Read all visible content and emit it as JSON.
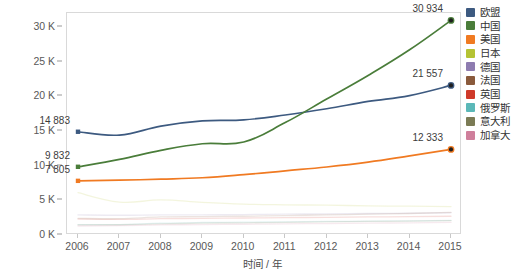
{
  "chart_data": {
    "type": "line",
    "title": "",
    "xlabel": "时间 / 年",
    "ylabel": "论文数量 / 篇",
    "x": [
      2006,
      2007,
      2008,
      2009,
      2010,
      2011,
      2012,
      2013,
      2014,
      2015
    ],
    "xtick_labels": [
      "2006",
      "2007",
      "2008",
      "2009",
      "2010",
      "2011",
      "2012",
      "2013",
      "2014",
      "2015"
    ],
    "ytick_labels": [
      "0 K",
      "5 K",
      "10 K",
      "15 K",
      "20 K",
      "25 K",
      "30 K"
    ],
    "ytick_values": [
      0,
      5000,
      10000,
      15000,
      20000,
      25000,
      30000
    ],
    "ylim": [
      0,
      32000
    ],
    "xlim": [
      2006,
      2015
    ],
    "grid": false,
    "legend_position": "right",
    "series": [
      {
        "name": "欧盟",
        "color": "#3d5a80",
        "emphasis": "strong",
        "values": [
          14883,
          14400,
          15700,
          16450,
          16600,
          17300,
          18200,
          19250,
          20100,
          21557
        ],
        "start_label": "14 883",
        "end_label": "21 557"
      },
      {
        "name": "中国",
        "color": "#4a7d3a",
        "emphasis": "strong",
        "values": [
          9832,
          10900,
          12200,
          13150,
          13400,
          16200,
          19600,
          23000,
          26700,
          30934
        ],
        "start_label": "9 832",
        "end_label": "30 934"
      },
      {
        "name": "美国",
        "color": "#f07a22",
        "emphasis": "strong",
        "values": [
          7805,
          7900,
          8050,
          8250,
          8700,
          9250,
          9800,
          10500,
          11400,
          12333
        ],
        "start_label": "7 805",
        "end_label": "12 333"
      },
      {
        "name": "日本",
        "color": "#b5c334",
        "emphasis": "faded",
        "values": [
          6100,
          4750,
          5050,
          4700,
          4450,
          4350,
          4300,
          4200,
          4150,
          4100
        ]
      },
      {
        "name": "德国",
        "color": "#8e7cb0",
        "emphasis": "faded",
        "values": [
          2900,
          2850,
          2900,
          2900,
          2950,
          3000,
          3050,
          3100,
          3150,
          3200
        ]
      },
      {
        "name": "法国",
        "color": "#8a5a3c",
        "emphasis": "faded",
        "values": [
          2400,
          2350,
          2600,
          2650,
          2700,
          2800,
          2900,
          3000,
          3100,
          3250
        ]
      },
      {
        "name": "英国",
        "color": "#cf3a2a",
        "emphasis": "faded",
        "values": [
          2300,
          2250,
          2350,
          2400,
          2450,
          2500,
          2550,
          2600,
          2650,
          2700
        ]
      },
      {
        "name": "俄罗斯",
        "color": "#5bb8b8",
        "emphasis": "faded",
        "values": [
          1500,
          1500,
          1700,
          1800,
          1850,
          1900,
          1950,
          2000,
          2050,
          2100
        ]
      },
      {
        "name": "意大利",
        "color": "#7b7b55",
        "emphasis": "faded",
        "values": [
          1450,
          1480,
          1600,
          1700,
          1750,
          1820,
          1880,
          1950,
          2000,
          2060
        ]
      },
      {
        "name": "加拿大",
        "color": "#cf7f9b",
        "emphasis": "faded",
        "values": [
          1300,
          1350,
          1450,
          1500,
          1550,
          1600,
          1650,
          1700,
          1760,
          1820
        ]
      }
    ],
    "annotations": [
      {
        "text": "14 883",
        "series": "欧盟",
        "x": 2006,
        "y": 14883,
        "align": "right"
      },
      {
        "text": "21 557",
        "series": "欧盟",
        "x": 2015,
        "y": 21557,
        "align": "right"
      },
      {
        "text": "9 832",
        "series": "中国",
        "x": 2006,
        "y": 9832,
        "align": "right"
      },
      {
        "text": "30 934",
        "series": "中国",
        "x": 2015,
        "y": 30934,
        "align": "right"
      },
      {
        "text": "7 805",
        "series": "美国",
        "x": 2006,
        "y": 7805,
        "align": "right"
      },
      {
        "text": "12 333",
        "series": "美国",
        "x": 2015,
        "y": 12333,
        "align": "right"
      }
    ]
  }
}
